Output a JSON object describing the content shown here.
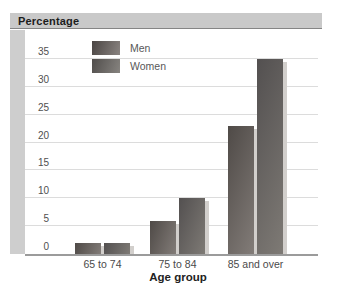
{
  "chart": {
    "title": "Percentage"
  },
  "chart_data": {
    "type": "bar",
    "title": "Percentage",
    "xlabel": "Age group",
    "ylabel": "Percentage",
    "categories": [
      "65 to 74",
      "75 to 84",
      "85 and over"
    ],
    "series": [
      {
        "name": "Men",
        "values": [
          2,
          6,
          23
        ]
      },
      {
        "name": "Women",
        "values": [
          2,
          10,
          35
        ]
      }
    ],
    "ylim": [
      0,
      35
    ],
    "ytick_step": 5,
    "yticks": [
      0,
      5,
      10,
      15,
      20,
      25,
      30,
      35
    ],
    "grid": true,
    "legend_position": "top-left-inside"
  },
  "colors": {
    "title_bar_bg": "#c9c9c9",
    "left_band_bg": "#cecece",
    "gridline": "#dcdcdc",
    "baseline": "#9b9b9b",
    "men_bar_dark": "#4f4a47",
    "men_bar_light": "#827c78",
    "women_bar_dark": "#535050",
    "women_bar_light": "#7e7a75",
    "bar_shadow": "#d2cfcc",
    "text": "#4a4a4a"
  }
}
